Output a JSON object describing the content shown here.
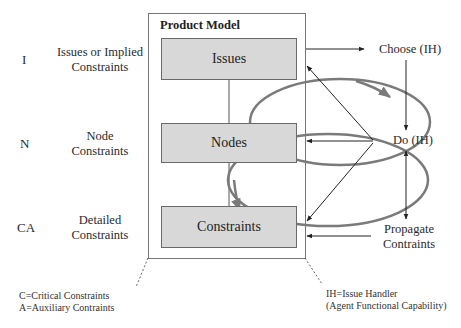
{
  "diagram": {
    "product_model": {
      "title": "Product Model",
      "boxes": [
        {
          "label": "Issues"
        },
        {
          "label": "Nodes"
        },
        {
          "label": "Constraints"
        }
      ]
    },
    "left_rows": [
      {
        "letter": "I",
        "description_line1": "Issues or Implied",
        "description_line2": "Constraints"
      },
      {
        "letter": "N",
        "description_line1": "Node",
        "description_line2": "Constraints"
      },
      {
        "letter": "CA",
        "description_line1": "Detailed",
        "description_line2": "Constraints"
      }
    ],
    "right_steps": [
      {
        "label": "Choose (IH)"
      },
      {
        "label": "Do (IH)"
      },
      {
        "label_line1": "Propagate",
        "label_line2": "Contraints"
      }
    ],
    "legend_left": {
      "line1": "C=Critical Constraints",
      "line2": "A=Auxiliary Contraints"
    },
    "legend_right": {
      "line1": "IH=Issue Handler",
      "line2": "(Agent Functional Capability)"
    },
    "colors": {
      "box_fill": "#d8d8d8",
      "box_border": "#6a6a6a",
      "ellipse_stroke": "#7a7a7a",
      "arrow_stroke": "#222222"
    }
  }
}
